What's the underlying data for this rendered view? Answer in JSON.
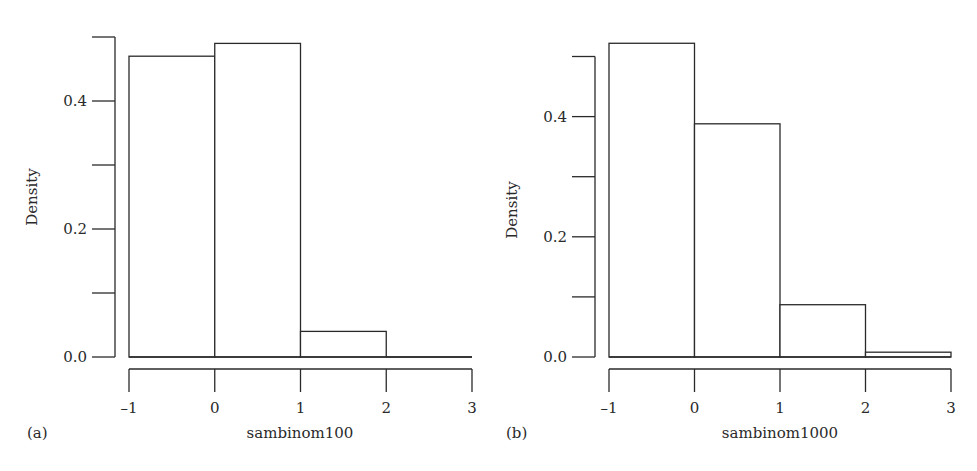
{
  "chart_data": [
    {
      "type": "bar",
      "subtype": "histogram",
      "panel_label": "(a)",
      "title": "",
      "xlabel": "sambinom100",
      "ylabel": "Density",
      "bin_edges": [
        -1,
        0,
        1,
        2,
        3
      ],
      "categories": [
        "[-1,0)",
        "[0,1)",
        "[1,2)",
        "[2,3)"
      ],
      "values": [
        0.47,
        0.49,
        0.04,
        0.0
      ],
      "xlim": [
        -1,
        3
      ],
      "ylim": [
        0,
        0.5
      ],
      "x_ticks": [
        "-1",
        "0",
        "1",
        "2",
        "3"
      ],
      "y_ticks": [
        0.0,
        0.1,
        0.2,
        0.3,
        0.4,
        0.5
      ],
      "y_tick_labels": [
        "0.0",
        "",
        "0.2",
        "",
        "0.4",
        ""
      ],
      "grid": false,
      "legend": null
    },
    {
      "type": "bar",
      "subtype": "histogram",
      "panel_label": "(b)",
      "title": "",
      "xlabel": "sambinom1000",
      "ylabel": "Density",
      "bin_edges": [
        -1,
        0,
        1,
        2,
        3
      ],
      "categories": [
        "[-1,0)",
        "[0,1)",
        "[1,2)",
        "[2,3)"
      ],
      "values": [
        0.522,
        0.388,
        0.087,
        0.008
      ],
      "xlim": [
        -1,
        3
      ],
      "ylim": [
        0,
        0.5
      ],
      "x_ticks": [
        "-1",
        "0",
        "1",
        "2",
        "3"
      ],
      "y_ticks": [
        0.0,
        0.1,
        0.2,
        0.3,
        0.4,
        0.5
      ],
      "y_tick_labels": [
        "0.0",
        "",
        "0.2",
        "",
        "0.4",
        ""
      ],
      "grid": false,
      "legend": null
    }
  ],
  "layout": {
    "panels": [
      {
        "y_axis_x": 115,
        "y_zero_px": 357,
        "px_per_unit_y": 640,
        "x_left_px": 129,
        "px_per_unit_x": 85.75,
        "x_axis_y": 369,
        "tick_len": 23,
        "ylabel_x": 37,
        "ylabel_y": 197,
        "xlabel_x": 300,
        "tag_x": 27,
        "text_y": 438,
        "tick_label_y": 413
      },
      {
        "y_axis_x": 595,
        "y_zero_px": 357,
        "px_per_unit_y": 601,
        "x_left_px": 609,
        "px_per_unit_x": 85.5,
        "x_axis_y": 369,
        "tick_len": 23,
        "ylabel_x": 517,
        "ylabel_y": 210,
        "xlabel_x": 780,
        "tag_x": 506,
        "text_y": 438,
        "tick_label_y": 413
      }
    ]
  },
  "colors": {
    "line": "#2a2a2a",
    "bar_fill": "#ffffff",
    "background": "#ffffff"
  }
}
